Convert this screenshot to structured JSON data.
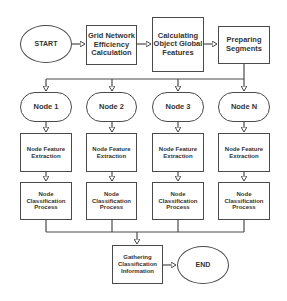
{
  "diagram": {
    "type": "flowchart",
    "colors": {
      "stroke": "#4a4a4a",
      "text": "#333333",
      "background": "#ffffff"
    },
    "start": {
      "label": "START"
    },
    "end": {
      "label": "END"
    },
    "top_row": [
      {
        "label": "Grid Network Efficiency Calculation"
      },
      {
        "label": "Calculating Object Global Features"
      },
      {
        "label": "Preparing Segments"
      }
    ],
    "columns": [
      {
        "node": "Node 1",
        "extraction": "Node Feature Extraction",
        "classification": "Node Classification Process"
      },
      {
        "node": "Node 2",
        "extraction": "Node Feature Extraction",
        "classification": "Node Classification Process"
      },
      {
        "node": "Node 3",
        "extraction": "Node Feature Extraction",
        "classification": "Node Classification Process"
      },
      {
        "node": "Node N",
        "extraction": "Node Feature Extraction",
        "classification": "Node Classification Process"
      }
    ],
    "gather": {
      "label": "Gathering Classification Information"
    },
    "edges": [
      [
        "START",
        "Grid Network Efficiency Calculation"
      ],
      [
        "Grid Network Efficiency Calculation",
        "Calculating Object Global Features"
      ],
      [
        "Calculating Object Global Features",
        "Preparing Segments"
      ],
      [
        "Preparing Segments",
        "Node 1"
      ],
      [
        "Preparing Segments",
        "Node 2"
      ],
      [
        "Preparing Segments",
        "Node 3"
      ],
      [
        "Preparing Segments",
        "Node N"
      ],
      [
        "Node i",
        "Node Feature Extraction"
      ],
      [
        "Node Feature Extraction",
        "Node Classification Process"
      ],
      [
        "Node Classification Process",
        "Gathering Classification Information"
      ],
      [
        "Gathering Classification Information",
        "END"
      ]
    ]
  }
}
